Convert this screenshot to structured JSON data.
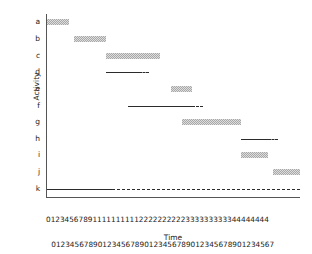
{
  "chart_data": {
    "type": "bar",
    "subtype": "gantt",
    "title": "",
    "xlabel": "Time",
    "ylabel": "Activity",
    "xlim": [
      0,
      47
    ],
    "grid": false,
    "legend": null,
    "categories": [
      "a",
      "b",
      "c",
      "d",
      "e",
      "f",
      "g",
      "h",
      "i",
      "j",
      "k"
    ],
    "xtick_labels": [
      "0",
      "1",
      "2",
      "3",
      "4",
      "5",
      "6",
      "7",
      "8",
      "9",
      "10",
      "11",
      "12",
      "13",
      "14",
      "15",
      "16",
      "17",
      "18",
      "19",
      "20",
      "21",
      "22",
      "23",
      "24",
      "25",
      "26",
      "27",
      "28",
      "29",
      "30",
      "31",
      "32",
      "33",
      "34",
      "35",
      "36",
      "37",
      "38",
      "39",
      "40",
      "41",
      "42",
      "43",
      "44",
      "45",
      "46",
      "47"
    ],
    "xtick_rows": {
      "tens": "012345678911111111112222222222333333333344444444",
      "ones": "012345678901234567890123456789012345678901234567"
    },
    "tasks": [
      {
        "activity": "a",
        "start": 0,
        "duration": 4,
        "end": 4,
        "style": "hatched",
        "float": 0
      },
      {
        "activity": "b",
        "start": 5,
        "duration": 6,
        "end": 11,
        "style": "hatched",
        "float": 0
      },
      {
        "activity": "c",
        "start": 11,
        "duration": 10,
        "end": 21,
        "style": "hatched",
        "float": 0
      },
      {
        "activity": "d",
        "start": 11,
        "duration": 6,
        "end": 17,
        "style": "line",
        "float": 2
      },
      {
        "activity": "e",
        "start": 23,
        "duration": 4,
        "end": 27,
        "style": "hatched",
        "float": 0
      },
      {
        "activity": "f",
        "start": 15,
        "duration": 12,
        "end": 27,
        "style": "line",
        "float": 2
      },
      {
        "activity": "g",
        "start": 25,
        "duration": 11,
        "end": 36,
        "style": "hatched",
        "float": 0
      },
      {
        "activity": "h",
        "start": 36,
        "duration": 5,
        "end": 41,
        "style": "line",
        "float": 2
      },
      {
        "activity": "i",
        "start": 36,
        "duration": 5,
        "end": 41,
        "style": "hatched",
        "float": 0
      },
      {
        "activity": "j",
        "start": 42,
        "duration": 5,
        "end": 47,
        "style": "hatched",
        "float": 0
      },
      {
        "activity": "k",
        "start": 0,
        "duration": 12,
        "end": 12,
        "style": "line",
        "float": 35
      }
    ],
    "colors": {
      "bar_fill": "#d8d8d8",
      "bar_hatch": "#9a9a9a",
      "line": "#2b2b2b",
      "axis": "#555555",
      "text": "#1a1a1a"
    }
  }
}
